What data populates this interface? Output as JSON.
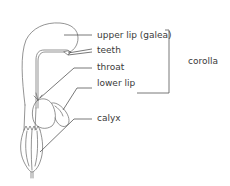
{
  "diagram": {
    "labels": {
      "upper_lip": "upper lip (galea)",
      "teeth": "teeth",
      "throat": "throat",
      "lower_lip": "lower lip",
      "calyx": "calyx",
      "group": "corolla"
    },
    "colors": {
      "line": "#555555",
      "text": "#3a3a3a",
      "background": "#ffffff"
    }
  }
}
